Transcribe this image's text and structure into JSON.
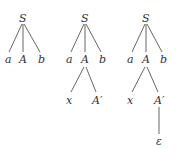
{
  "figure": {
    "trees": [
      {
        "id": "tree-1",
        "nodes": {
          "root": "S",
          "c1": "a",
          "c2": "A",
          "c3": "b"
        }
      },
      {
        "id": "tree-2",
        "nodes": {
          "root": "S",
          "c1": "a",
          "c2": "A",
          "c3": "b",
          "g1": "x",
          "g2": "A′"
        }
      },
      {
        "id": "tree-3",
        "nodes": {
          "root": "S",
          "c1": "a",
          "c2": "A",
          "c3": "b",
          "g1": "x",
          "g2": "A′",
          "gg1": "ε"
        }
      }
    ]
  },
  "colors": {
    "text": "#333333",
    "edge": "#555555",
    "background": "#ffffff"
  }
}
